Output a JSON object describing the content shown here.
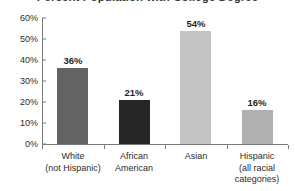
{
  "chart_data": {
    "type": "bar",
    "title": "Percent Population with College Degree",
    "xlabel": "",
    "ylabel": "",
    "categories": [
      "White\n(not Hispanic)",
      "African\nAmerican",
      "Asian",
      "Hispanic\n(all racial\ncategories)"
    ],
    "category_lines": [
      [
        "White",
        "(not Hispanic)"
      ],
      [
        "African",
        "American"
      ],
      [
        "Asian"
      ],
      [
        "Hispanic",
        "(all racial",
        "categories)"
      ]
    ],
    "values": [
      36,
      21,
      54,
      16
    ],
    "value_labels": [
      "36%",
      "21%",
      "54%",
      "16%"
    ],
    "bar_colors": [
      "#636363",
      "#262626",
      "#c4c4c4",
      "#b0b0b0"
    ],
    "ylim": [
      0,
      60
    ],
    "ytick_values": [
      0,
      10,
      20,
      30,
      40,
      50,
      60
    ],
    "ytick_labels": [
      "0%",
      "10%",
      "20%",
      "30%",
      "40%",
      "50%",
      "60%"
    ],
    "grid": false,
    "legend": "none",
    "axis_color": "#7b7b7b"
  }
}
